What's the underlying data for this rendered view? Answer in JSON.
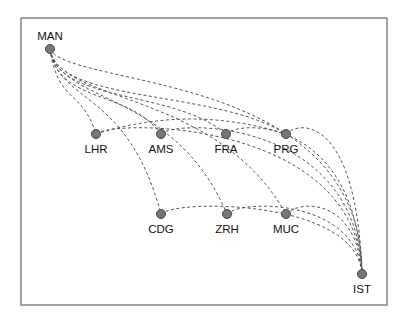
{
  "diagram": {
    "type": "network-graph",
    "edge_style": "dashed-curved",
    "colors": {
      "frame": "#666666",
      "edge": "#555555",
      "node_fill": "#777777",
      "node_stroke": "#444444",
      "label": "#111111"
    },
    "nodes": [
      {
        "id": "MAN",
        "label": "MAN",
        "x": 50,
        "y": 49,
        "label_pos": "above"
      },
      {
        "id": "LHR",
        "label": "LHR",
        "x": 96,
        "y": 134,
        "label_pos": "below"
      },
      {
        "id": "AMS",
        "label": "AMS",
        "x": 161,
        "y": 134,
        "label_pos": "below"
      },
      {
        "id": "FRA",
        "label": "FRA",
        "x": 226,
        "y": 134,
        "label_pos": "below"
      },
      {
        "id": "PRG",
        "label": "PRG",
        "x": 286,
        "y": 134,
        "label_pos": "below"
      },
      {
        "id": "CDG",
        "label": "CDG",
        "x": 161,
        "y": 214,
        "label_pos": "below"
      },
      {
        "id": "ZRH",
        "label": "ZRH",
        "x": 227,
        "y": 214,
        "label_pos": "below"
      },
      {
        "id": "MUC",
        "label": "MUC",
        "x": 286,
        "y": 214,
        "label_pos": "below"
      },
      {
        "id": "IST",
        "label": "IST",
        "x": 362,
        "y": 274,
        "label_pos": "below"
      }
    ],
    "edges": [
      {
        "from": "MAN",
        "to": "LHR"
      },
      {
        "from": "MAN",
        "to": "AMS"
      },
      {
        "from": "MAN",
        "to": "FRA"
      },
      {
        "from": "MAN",
        "to": "PRG"
      },
      {
        "from": "MAN",
        "to": "CDG"
      },
      {
        "from": "MAN",
        "to": "ZRH"
      },
      {
        "from": "MAN",
        "to": "MUC"
      },
      {
        "from": "MAN",
        "to": "IST"
      },
      {
        "from": "LHR",
        "to": "IST"
      },
      {
        "from": "AMS",
        "to": "IST"
      },
      {
        "from": "FRA",
        "to": "IST"
      },
      {
        "from": "PRG",
        "to": "IST"
      },
      {
        "from": "CDG",
        "to": "IST"
      },
      {
        "from": "ZRH",
        "to": "IST"
      },
      {
        "from": "MUC",
        "to": "IST"
      },
      {
        "from": "LHR",
        "to": "PRG"
      }
    ]
  }
}
